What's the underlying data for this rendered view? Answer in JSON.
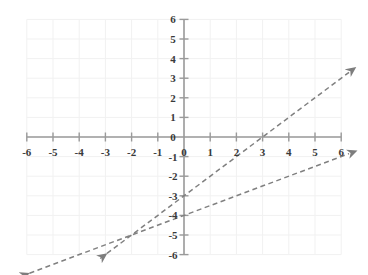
{
  "chart_data": {
    "type": "line",
    "title": "",
    "xlabel": "",
    "ylabel": "",
    "xlim": [
      -6,
      6
    ],
    "ylim": [
      -6,
      6
    ],
    "grid": true,
    "legend": "none",
    "x_ticks": [
      -6,
      -5,
      -4,
      -3,
      -2,
      -1,
      0,
      1,
      2,
      3,
      4,
      5,
      6
    ],
    "y_ticks": [
      -6,
      -5,
      -4,
      -3,
      -2,
      -1,
      0,
      1,
      2,
      3,
      4,
      5,
      6
    ],
    "x_tick_labels": [
      "-6",
      "-5",
      "-4",
      "-3",
      "-2",
      "-1",
      "0",
      "1",
      "2",
      "3",
      "4",
      "5",
      "6"
    ],
    "y_tick_labels": [
      "-6",
      "-5",
      "-4",
      "-3",
      "-2",
      "-1",
      "0",
      "1",
      "2",
      "3",
      "4",
      "5",
      "6"
    ],
    "series": [
      {
        "name": "line-1",
        "equation": "y = x - 3",
        "slope": 1,
        "intercept": -3,
        "style": "dashed",
        "color": "#808080",
        "arrow_start": true,
        "arrow_end": true,
        "points": [
          [
            -6,
            -9
          ],
          [
            -2,
            -5
          ],
          [
            0,
            -3
          ],
          [
            3,
            0
          ],
          [
            6,
            3
          ]
        ],
        "x_drawn": [
          -3.2,
          6.3
        ],
        "y_drawn": [
          -6.2,
          3.3
        ]
      },
      {
        "name": "line-2",
        "equation": "y = 0.5x - 4",
        "slope": 0.5,
        "intercept": -4,
        "style": "dashed",
        "color": "#808080",
        "arrow_start": true,
        "arrow_end": true,
        "points": [
          [
            -6,
            -7
          ],
          [
            -2,
            -5
          ],
          [
            0,
            -4
          ],
          [
            6,
            -1
          ]
        ],
        "x_drawn": [
          -6.2,
          6.3
        ],
        "y_drawn": [
          -7.1,
          -0.85
        ]
      }
    ],
    "intersection": [
      -2,
      -5
    ],
    "colors": {
      "grid": "#f0f0f0",
      "axis": "#9a9a9a",
      "tick_label": "#3a3a3a",
      "line": "#808080",
      "background": "#ffffff"
    }
  },
  "axes": {
    "x_axis_name": "x-axis",
    "y_axis_name": "y-axis",
    "origin_label": "0"
  }
}
